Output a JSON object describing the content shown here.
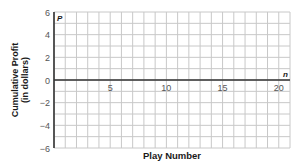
{
  "chart_data": {
    "type": "line",
    "title": "",
    "xlabel": "Play Number",
    "ylabel": "Cumulative Profit (in dollars)",
    "ylabel_lines": [
      "Cumulative Profit",
      "(in dollars)"
    ],
    "x_axis_var": "n",
    "y_axis_var": "P",
    "xlim": [
      0,
      21
    ],
    "ylim": [
      -6,
      6
    ],
    "x_ticks": [
      5,
      10,
      15,
      20
    ],
    "y_ticks": [
      -6,
      -4,
      -2,
      0,
      2,
      4,
      6
    ],
    "grid": true,
    "grid_step_x": 1,
    "grid_step_y": 1,
    "series": [],
    "legend": null
  },
  "colors": {
    "grid": "#c8c8c8",
    "axis": "#333333",
    "text": "#555555",
    "label": "#1a1a1a"
  }
}
